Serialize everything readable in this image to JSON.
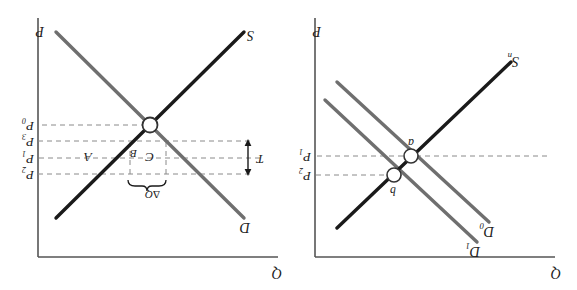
{
  "figure": {
    "type": "supply-demand-diagram-pair",
    "orientation_note": "image rendered rotated 180 degrees",
    "colors": {
      "demand_curve": "#6f6f6f",
      "supply_curve": "#1a1a1a",
      "axis": "#555555",
      "dashed_guide": "#8a8a8a",
      "point_marker_fill": "#ffffff",
      "background": "#ffffff"
    }
  },
  "panel_left": {
    "axis_y_label": "Q",
    "axis_x_label": "P",
    "curves": [
      {
        "name": "demand-shifted",
        "label_base": "D",
        "label_sub": "1"
      },
      {
        "name": "demand-original",
        "label_base": "D",
        "label_sub": "0"
      },
      {
        "name": "supply",
        "label_base": "S",
        "label_sub": "n"
      }
    ],
    "points": [
      {
        "name": "point-a",
        "label": "a"
      },
      {
        "name": "point-b",
        "label": "b"
      }
    ],
    "price_levels": [
      {
        "label_base": "P",
        "label_sub": "1"
      },
      {
        "label_base": "P",
        "label_sub": "2"
      }
    ]
  },
  "panel_right": {
    "axis_y_label": "Q",
    "axis_x_label": "P",
    "curves": [
      {
        "name": "demand",
        "label_base": "D",
        "label_sub": ""
      },
      {
        "name": "supply",
        "label_base": "S",
        "label_sub": ""
      }
    ],
    "points": [
      {
        "name": "equilibrium-point",
        "label": ""
      }
    ],
    "price_levels": [
      {
        "label_base": "P",
        "label_sub": "2"
      },
      {
        "label_base": "P",
        "label_sub": "1"
      },
      {
        "label_base": "P",
        "label_sub": "3"
      },
      {
        "label_base": "P",
        "label_sub": "0"
      }
    ],
    "regions": [
      {
        "name": "region-a",
        "label": "A"
      },
      {
        "name": "region-b",
        "label": "B"
      },
      {
        "name": "region-c",
        "label": "C"
      }
    ],
    "annotations": [
      {
        "name": "tax-wedge",
        "label": "T"
      },
      {
        "name": "quantity-change-brace",
        "label_base": "Δ",
        "label_sub": "Q"
      }
    ]
  }
}
